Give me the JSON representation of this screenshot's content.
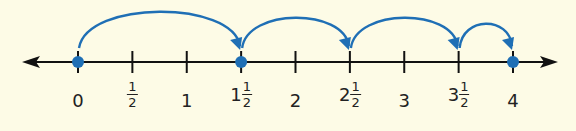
{
  "number_line": {
    "range": [
      0,
      4
    ],
    "tick_step": 0.5,
    "axis_y": 62,
    "x0": 78,
    "unit_px": 108.75,
    "line_color": "#111111",
    "accent_color": "#1f6fb5",
    "background_color": "#fdfbe6",
    "labels": [
      {
        "value": 0,
        "whole": "0",
        "num": "",
        "den": ""
      },
      {
        "value": 0.5,
        "whole": "",
        "num": "1",
        "den": "2"
      },
      {
        "value": 1,
        "whole": "1",
        "num": "",
        "den": ""
      },
      {
        "value": 1.5,
        "whole": "1",
        "num": "1",
        "den": "2"
      },
      {
        "value": 2,
        "whole": "2",
        "num": "",
        "den": ""
      },
      {
        "value": 2.5,
        "whole": "2",
        "num": "1",
        "den": "2"
      },
      {
        "value": 3,
        "whole": "3",
        "num": "",
        "den": ""
      },
      {
        "value": 3.5,
        "whole": "3",
        "num": "1",
        "den": "2"
      },
      {
        "value": 4,
        "whole": "4",
        "num": "",
        "den": ""
      }
    ],
    "points": [
      0,
      1.5,
      4
    ],
    "jumps": [
      {
        "from": 0,
        "to": 1.5,
        "height": 48
      },
      {
        "from": 1.5,
        "to": 2.5,
        "height": 40
      },
      {
        "from": 2.5,
        "to": 3.5,
        "height": 40
      },
      {
        "from": 3.5,
        "to": 4,
        "height": 32
      }
    ]
  }
}
